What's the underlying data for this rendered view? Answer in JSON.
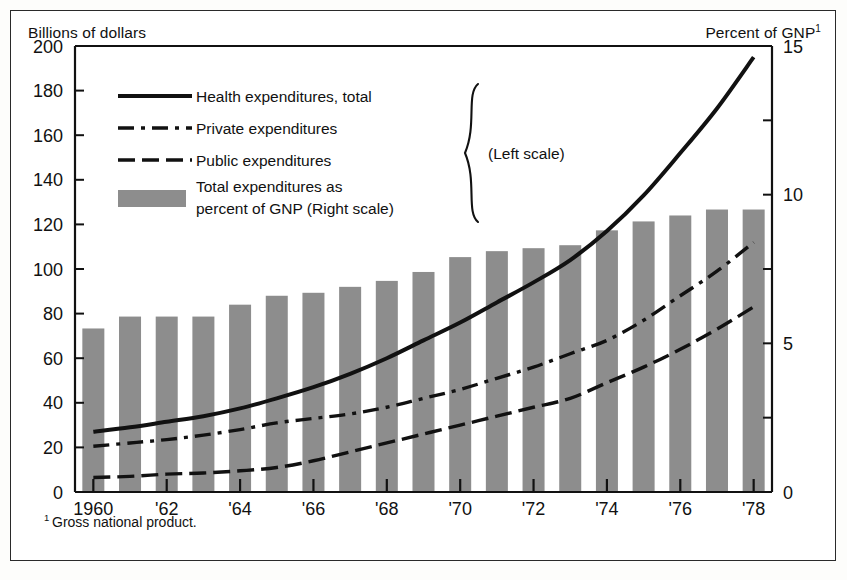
{
  "figure": {
    "left_axis_caption": "Billions of dollars",
    "right_axis_caption": "Percent of GNP",
    "right_axis_caption_sup": "1",
    "footnote_marker": "1",
    "footnote": "Gross national product."
  },
  "legend": {
    "items": [
      {
        "key": "health-total",
        "label": "Health expenditures, total",
        "style": "solid-thick",
        "scale": "left"
      },
      {
        "key": "private",
        "label": "Private expenditures",
        "style": "dash-dot",
        "scale": "left"
      },
      {
        "key": "public",
        "label": "Public expenditures",
        "style": "dashed",
        "scale": "left"
      },
      {
        "key": "gnp-bars",
        "label_line1": "Total expenditures as",
        "label_line2": "percent of GNP (Right scale)",
        "style": "swatch",
        "scale": "right"
      }
    ],
    "brace_label": "(Left scale)"
  },
  "chart_data": {
    "type": "bar",
    "title": "",
    "subtitle": "",
    "xlabel": "",
    "ylabel": "Billions of dollars",
    "y2label": "Percent of GNP",
    "grid": false,
    "legend_position": "inside-top-left",
    "x": [
      1960,
      1961,
      1962,
      1963,
      1964,
      1965,
      1966,
      1967,
      1968,
      1969,
      1970,
      1971,
      1972,
      1973,
      1974,
      1975,
      1976,
      1977,
      1978
    ],
    "categories": [
      "1960",
      "'61",
      "'62",
      "'63",
      "'64",
      "'65",
      "'66",
      "'67",
      "'68",
      "'69",
      "'70",
      "'71",
      "'72",
      "'73",
      "'74",
      "'75",
      "'76",
      "'77",
      "'78"
    ],
    "xtick_labels": [
      "1960",
      "'62",
      "'64",
      "'66",
      "'68",
      "'70",
      "'72",
      "'74",
      "'76",
      "'78"
    ],
    "xtick_years": [
      1960,
      1962,
      1964,
      1966,
      1968,
      1970,
      1972,
      1974,
      1976,
      1978
    ],
    "ylim": [
      0,
      200
    ],
    "yticks": [
      0,
      20,
      40,
      60,
      80,
      100,
      120,
      140,
      160,
      180,
      200
    ],
    "ytick_labels": [
      "0",
      "20",
      "40",
      "60",
      "80",
      "100",
      "120",
      "140",
      "160",
      "180",
      "200"
    ],
    "y2lim": [
      0,
      15
    ],
    "y2ticks": [
      0,
      5,
      10,
      15
    ],
    "y2tick_labels": [
      "0",
      "5",
      "10",
      "15"
    ],
    "y2_minor_ticks": [
      2.5,
      7.5,
      12.5
    ],
    "bar_color": "#8d8d8d",
    "line_color": "#111111",
    "series": [
      {
        "name": "Total expenditures as percent of GNP (Right scale)",
        "type": "bar",
        "axis": "right",
        "values": [
          5.5,
          5.9,
          5.9,
          5.9,
          6.3,
          6.6,
          6.7,
          6.9,
          7.1,
          7.4,
          7.9,
          8.1,
          8.2,
          8.3,
          8.8,
          9.1,
          9.3,
          9.5,
          9.5
        ]
      },
      {
        "name": "Health expenditures, total",
        "type": "line",
        "axis": "left",
        "style": "solid-thick",
        "values": [
          27,
          29,
          31.5,
          34,
          37.5,
          42,
          47,
          53,
          60,
          68,
          76,
          85,
          94,
          104,
          117,
          133,
          152,
          172,
          195
        ]
      },
      {
        "name": "Private expenditures",
        "type": "line",
        "axis": "left",
        "style": "dash-dot",
        "values": [
          20.5,
          22,
          23.5,
          25.5,
          28,
          31,
          33,
          35,
          38,
          42,
          46,
          51,
          56,
          62,
          68,
          77,
          88,
          99,
          112
        ]
      },
      {
        "name": "Public expenditures",
        "type": "line",
        "axis": "left",
        "style": "dashed",
        "values": [
          6.5,
          7,
          8,
          8.5,
          9.5,
          11,
          14,
          18,
          22,
          26,
          30,
          34,
          38,
          42,
          49,
          56,
          64,
          73,
          83
        ]
      }
    ]
  }
}
